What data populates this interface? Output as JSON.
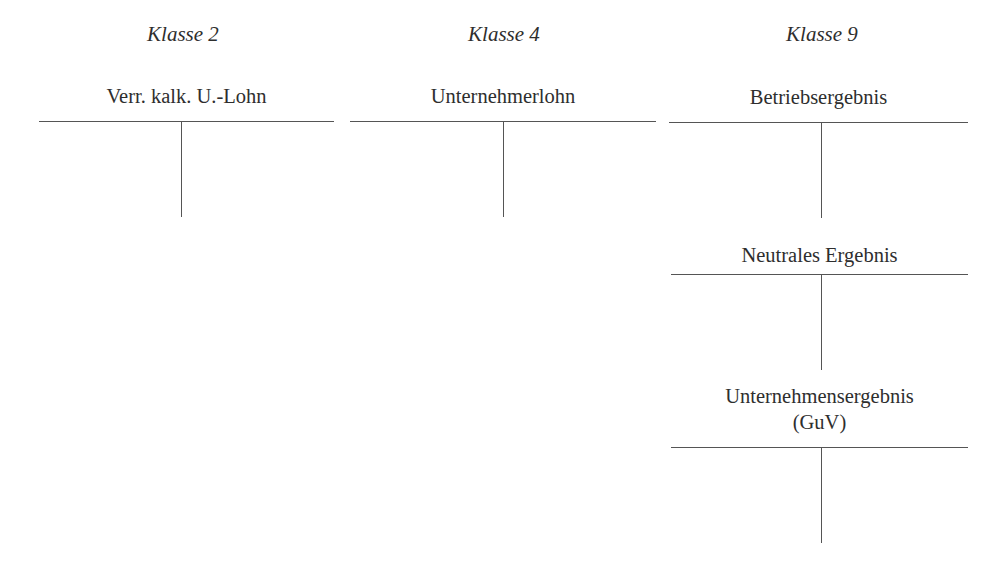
{
  "diagram": {
    "type": "t-accounts",
    "line_color": "#555555",
    "text_color": "#2e2e2e",
    "columns": [
      {
        "heading": "Klasse 2",
        "accounts": [
          {
            "title": "Verr. kalk. U.-Lohn"
          }
        ]
      },
      {
        "heading": "Klasse 4",
        "accounts": [
          {
            "title": "Unternehmerlohn"
          }
        ]
      },
      {
        "heading": "Klasse 9",
        "accounts": [
          {
            "title": "Betriebsergebnis"
          },
          {
            "title": "Neutrales Ergebnis"
          },
          {
            "title_line1": "Unternehmensergebnis",
            "title_line2": "(GuV)"
          }
        ]
      }
    ]
  }
}
